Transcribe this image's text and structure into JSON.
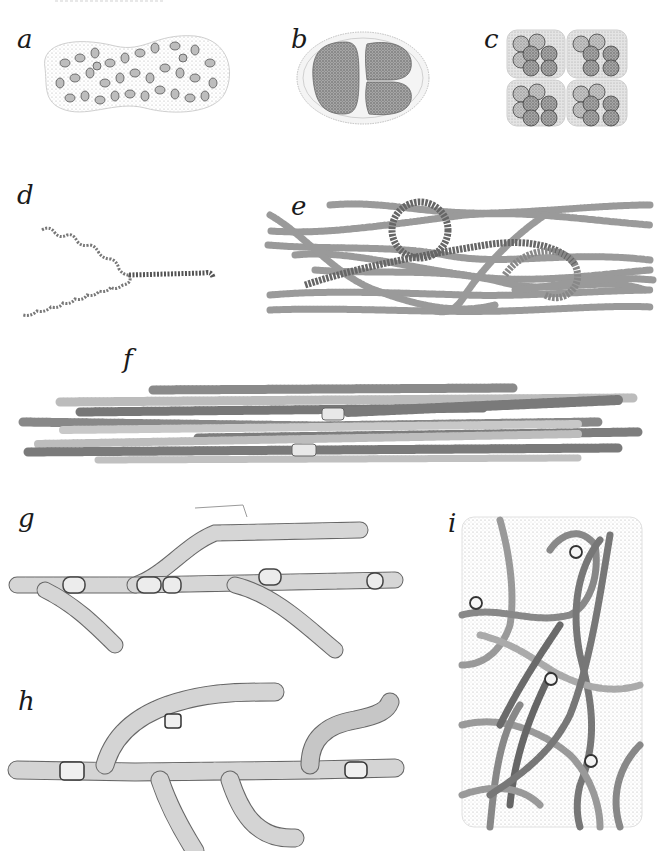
{
  "plate": {
    "background": "#ffffff",
    "ink_color": "#3a3a3a",
    "header_fragment": "",
    "panels": [
      {
        "id": "a",
        "label": "a",
        "subject": "colonial coccoid cells in gelatinous envelope"
      },
      {
        "id": "b",
        "label": "b",
        "subject": "two-celled colony with sheath"
      },
      {
        "id": "c",
        "label": "c",
        "subject": "cuboidal packets of spherical cells"
      },
      {
        "id": "d",
        "label": "d",
        "subject": "spiral filaments"
      },
      {
        "id": "e",
        "label": "e",
        "subject": "tangled trichomes"
      },
      {
        "id": "f",
        "label": "f",
        "subject": "parallel filaments with heterocysts"
      },
      {
        "id": "g",
        "label": "g",
        "subject": "false-branched filaments with sheath"
      },
      {
        "id": "h",
        "label": "h",
        "subject": "true-branched filament"
      },
      {
        "id": "i",
        "label": "i",
        "subject": "moniliform filaments in mucilage"
      }
    ]
  }
}
